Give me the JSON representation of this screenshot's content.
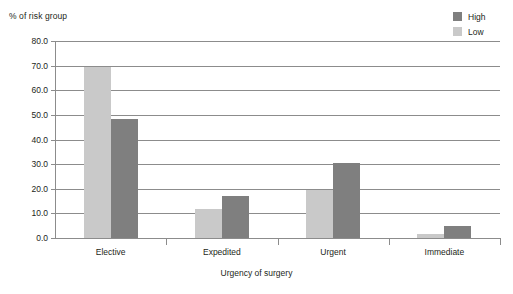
{
  "chart_data": {
    "type": "bar",
    "title": "",
    "xlabel": "Urgency of surgery",
    "ylabel": "% of risk group",
    "categories": [
      "Elective",
      "Expedited",
      "Urgent",
      "Immediate"
    ],
    "series": [
      {
        "name": "Low",
        "color": "#c9c9c9",
        "values": [
          69.5,
          11.7,
          19.5,
          1.5
        ]
      },
      {
        "name": "High",
        "color": "#7f7f7f",
        "values": [
          48.5,
          17.2,
          30.5,
          5.0
        ]
      }
    ],
    "ylim": [
      0.0,
      80.0
    ],
    "ytick_labels": [
      "80.0",
      "70.0",
      "60.0",
      "50.0",
      "40.0",
      "30.0",
      "20.0",
      "10.0",
      "0.0"
    ],
    "ytick_values": [
      80.0,
      70.0,
      60.0,
      50.0,
      40.0,
      30.0,
      20.0,
      10.0,
      0.0
    ],
    "grid": true,
    "legend_position": "top-right",
    "legend_entries": [
      "High",
      "Low"
    ]
  },
  "axes": {
    "y_title": "% of risk group",
    "x_title": "Urgency of surgery"
  },
  "legend": {
    "items": [
      {
        "label": "High",
        "color": "#7f7f7f"
      },
      {
        "label": "Low",
        "color": "#c9c9c9"
      }
    ]
  },
  "colors": {
    "low": "#c9c9c9",
    "high": "#7f7f7f",
    "grid": "#8c8c8c",
    "text": "#231f20",
    "background": "#ffffff"
  }
}
